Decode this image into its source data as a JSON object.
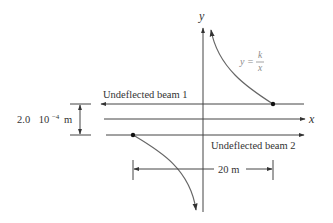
{
  "figure": {
    "axes": {
      "x_label": "x",
      "y_label": "y"
    },
    "curve_label": {
      "lhs": "y =",
      "numerator": "k",
      "denominator": "x"
    },
    "beams": [
      {
        "label": "Undeflected beam 1",
        "direction": "left"
      },
      {
        "label": "Undeflected beam 2",
        "direction": "right"
      }
    ],
    "separation": {
      "value": "2.0",
      "power_base": "10",
      "exponent": "−4",
      "unit": "m"
    },
    "horizontal_distance": {
      "label": "20 m"
    },
    "colors": {
      "line": "#444444",
      "curve": "#666666",
      "curve_label": "#8a8a8a",
      "dot": "#111111"
    }
  }
}
